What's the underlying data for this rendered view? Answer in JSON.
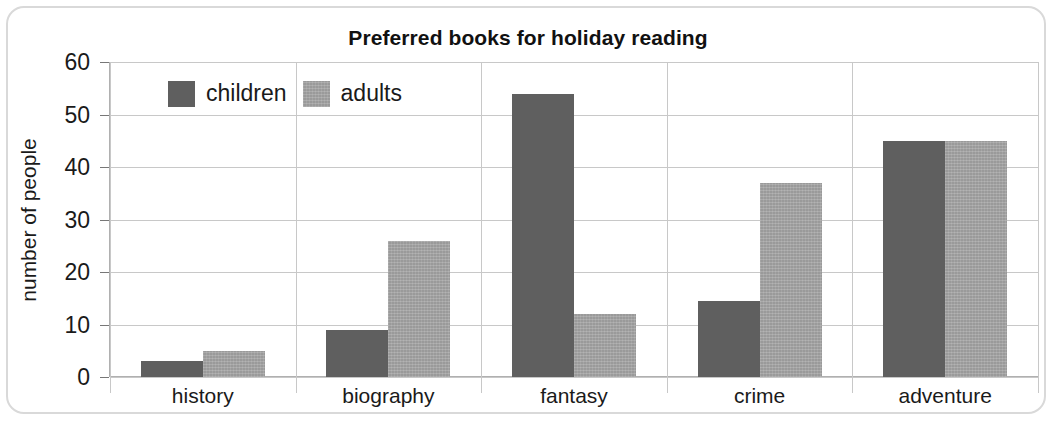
{
  "chart_data": {
    "type": "bar",
    "title": "Preferred books for holiday reading",
    "xlabel": "",
    "ylabel": "number of people",
    "categories": [
      "history",
      "biography",
      "fantasy",
      "crime",
      "adventure"
    ],
    "series": [
      {
        "name": "children",
        "color": "#5f5f5f",
        "values": [
          3,
          9,
          54,
          14.5,
          45
        ]
      },
      {
        "name": "adults",
        "color": "#9a9a9a",
        "values": [
          5,
          26,
          12,
          37,
          45
        ]
      }
    ],
    "ylim": [
      0,
      60
    ],
    "yticks": [
      0,
      10,
      20,
      30,
      40,
      50,
      60
    ],
    "ytick_labels": [
      "0",
      "10",
      "20",
      "30",
      "40",
      "50",
      "60"
    ],
    "grid": "horizontal-and-category-separators",
    "legend_position": "upper-left-inside"
  },
  "legend": {
    "entries": [
      {
        "label": "children",
        "swatch": "children-color-swatch"
      },
      {
        "label": "adults",
        "swatch": "adults-color-swatch"
      }
    ]
  }
}
